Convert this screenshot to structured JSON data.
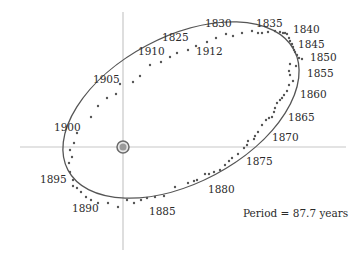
{
  "diagram": {
    "caption": "Period = 87.7 years",
    "colors": {
      "background": "#ffffff",
      "axes": "#c8c8c8",
      "orbit": "#555555",
      "points": "#555555",
      "star_fill": "#9a9a9a",
      "star_ring": "#6a6a6a",
      "text": "#2b2b2b"
    },
    "axes": {
      "vertical": {
        "x": 123,
        "y1": 12,
        "y2": 250
      },
      "horizontal": {
        "y": 147,
        "x1": 20,
        "x2": 346
      }
    },
    "primary_star": {
      "icon": "star-icon",
      "cx": 123,
      "cy": 147,
      "r": 6
    },
    "orbit_ellipse": {
      "cx": 181,
      "cy": 110,
      "rx": 128,
      "ry": 73,
      "rotate": -28
    },
    "year_labels": [
      {
        "text": "1830",
        "x": 205,
        "y": 27
      },
      {
        "text": "1835",
        "x": 256,
        "y": 27
      },
      {
        "text": "1840",
        "x": 293,
        "y": 33
      },
      {
        "text": "1845",
        "x": 298,
        "y": 48
      },
      {
        "text": "1850",
        "x": 310,
        "y": 61
      },
      {
        "text": "1855",
        "x": 307,
        "y": 77
      },
      {
        "text": "1860",
        "x": 300,
        "y": 98
      },
      {
        "text": "1865",
        "x": 288,
        "y": 121
      },
      {
        "text": "1870",
        "x": 272,
        "y": 141
      },
      {
        "text": "1875",
        "x": 246,
        "y": 165
      },
      {
        "text": "1880",
        "x": 208,
        "y": 193
      },
      {
        "text": "1885",
        "x": 149,
        "y": 215
      },
      {
        "text": "1890",
        "x": 72,
        "y": 212
      },
      {
        "text": "1895",
        "x": 40,
        "y": 183
      },
      {
        "text": "1900",
        "x": 54,
        "y": 131
      },
      {
        "text": "1905",
        "x": 93,
        "y": 83
      },
      {
        "text": "1910",
        "x": 138,
        "y": 55
      },
      {
        "text": "1912",
        "x": 196,
        "y": 55
      },
      {
        "text": "1825",
        "x": 162,
        "y": 41
      }
    ],
    "observations": [
      [
        91,
        117
      ],
      [
        98,
        106
      ],
      [
        107,
        98
      ],
      [
        116,
        94
      ],
      [
        120,
        84
      ],
      [
        133,
        82
      ],
      [
        140,
        76
      ],
      [
        150,
        65
      ],
      [
        161,
        62
      ],
      [
        170,
        57
      ],
      [
        177,
        53
      ],
      [
        188,
        50
      ],
      [
        196,
        46
      ],
      [
        207,
        42
      ],
      [
        216,
        38
      ],
      [
        226,
        34
      ],
      [
        233,
        36
      ],
      [
        242,
        33
      ],
      [
        252,
        31
      ],
      [
        258,
        33
      ],
      [
        262,
        33
      ],
      [
        268,
        32
      ],
      [
        275,
        31
      ],
      [
        280,
        32
      ],
      [
        283,
        33
      ],
      [
        285,
        33
      ],
      [
        287,
        34
      ],
      [
        289,
        38
      ],
      [
        290,
        41
      ],
      [
        292,
        44
      ],
      [
        293,
        47
      ],
      [
        294,
        50
      ],
      [
        295,
        52
      ],
      [
        297,
        55
      ],
      [
        299,
        58
      ],
      [
        302,
        59
      ],
      [
        296,
        66
      ],
      [
        290,
        64
      ],
      [
        289,
        71
      ],
      [
        290,
        75
      ],
      [
        293,
        81
      ],
      [
        289,
        85
      ],
      [
        287,
        91
      ],
      [
        284,
        95
      ],
      [
        282,
        98
      ],
      [
        280,
        100
      ],
      [
        277,
        103
      ],
      [
        275,
        108
      ],
      [
        274,
        112
      ],
      [
        272,
        117
      ],
      [
        269,
        118
      ],
      [
        266,
        120
      ],
      [
        262,
        125
      ],
      [
        258,
        132
      ],
      [
        255,
        136
      ],
      [
        254,
        139
      ],
      [
        248,
        141
      ],
      [
        247,
        145
      ],
      [
        244,
        148
      ],
      [
        238,
        154
      ],
      [
        232,
        158
      ],
      [
        229,
        161
      ],
      [
        225,
        165
      ],
      [
        220,
        170
      ],
      [
        214,
        172
      ],
      [
        209,
        174
      ],
      [
        205,
        174
      ],
      [
        197,
        180
      ],
      [
        194,
        181
      ],
      [
        188,
        183
      ],
      [
        175,
        187
      ],
      [
        164,
        196
      ],
      [
        155,
        197
      ],
      [
        147,
        198
      ],
      [
        141,
        200
      ],
      [
        134,
        203
      ],
      [
        127,
        200
      ],
      [
        118,
        207
      ],
      [
        108,
        203
      ],
      [
        98,
        203
      ],
      [
        91,
        200
      ],
      [
        86,
        197
      ],
      [
        81,
        192
      ],
      [
        77,
        188
      ],
      [
        73,
        186
      ],
      [
        73,
        180
      ],
      [
        70,
        172
      ],
      [
        69,
        163
      ],
      [
        72,
        157
      ],
      [
        70,
        150
      ],
      [
        74,
        143
      ],
      [
        77,
        133
      ]
    ]
  }
}
